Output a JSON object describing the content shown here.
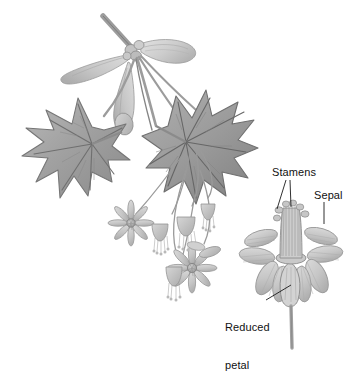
{
  "figure": {
    "kind": "botanical-illustration",
    "medium": "grayscale pencil and wash drawing",
    "background_color": "#ffffff",
    "ink_color": "#111111"
  },
  "labels": {
    "stamens": "Stamens",
    "sepal": "Sepal",
    "reduced_petal": "Reduced\npetal",
    "reduced_petal_line1": "Reduced",
    "reduced_petal_line2": "petal"
  },
  "palette": {
    "leaf_dark": "#8d8d8d",
    "leaf_mid": "#a8a8a8",
    "leaf_light": "#c2c2c2",
    "vein": "#6f6f6f",
    "samara_wing": "#cfcfcf",
    "samara_wing_edge": "#9a9a9a",
    "stem": "#9c9c9c",
    "flower_petal": "#c9c9c9",
    "flower_petal_edge": "#9e9e9e",
    "flower_center": "#8a8a8a",
    "stamen_line": "#8f8f8f",
    "leader_line": "#1a1a1a",
    "outline": "#7a7a7a"
  },
  "parts": {
    "samaras": {
      "name": "winged samara fruit cluster",
      "count": 4,
      "position": "top-center"
    },
    "leaves": {
      "name": "palmate maple leaves",
      "count": 2,
      "lobes_per_leaf": 5,
      "positions": [
        "left",
        "center-right"
      ]
    },
    "flower_clusters": {
      "name": "pendant flower clusters",
      "open_flowers": 2,
      "drooping_buds": 4,
      "position": "lower-center"
    },
    "detail_flower": {
      "name": "magnified single flower",
      "sepal_count": 8,
      "position": "right",
      "has_central_stamen_column": true
    }
  }
}
